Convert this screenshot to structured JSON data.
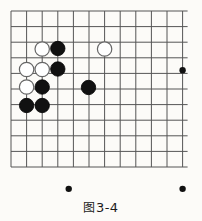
{
  "figure": {
    "caption": "图 3-4",
    "caption_label": "图",
    "caption_number": "3-4",
    "kind": "go-board-diagram"
  },
  "board": {
    "columns": 12,
    "rows": 11,
    "origin_x": 11,
    "origin_y": 11,
    "spacing_x": 15.6,
    "spacing_y": 15.6,
    "line_color": "#555555",
    "line_width": 1,
    "background": "#fcfbf8",
    "star_point_color": "#111111",
    "star_point_radius": 3.2,
    "star_points": [
      {
        "col": 11,
        "row": 3.8,
        "name": "star-right"
      },
      {
        "col": 3.7,
        "row": 11.4,
        "name": "star-bottom-left"
      },
      {
        "col": 11,
        "row": 11.4,
        "name": "star-bottom-right"
      }
    ]
  },
  "stones": {
    "black_fill": "#111111",
    "black_stroke": "#000000",
    "white_fill": "#ffffff",
    "white_stroke": "#666666",
    "radius": 7.2,
    "items": [
      {
        "id": "w1",
        "color": "white",
        "cx": 42.2,
        "cy": 49.0,
        "label": "white-stone"
      },
      {
        "id": "b1",
        "color": "black",
        "cx": 57.8,
        "cy": 48.5,
        "label": "black-stone"
      },
      {
        "id": "w2",
        "color": "white",
        "cx": 104.6,
        "cy": 49.0,
        "label": "white-stone"
      },
      {
        "id": "w3",
        "color": "white",
        "cx": 26.6,
        "cy": 69.5,
        "label": "white-stone"
      },
      {
        "id": "w4",
        "color": "white",
        "cx": 42.2,
        "cy": 69.5,
        "label": "white-stone"
      },
      {
        "id": "b2",
        "color": "black",
        "cx": 57.8,
        "cy": 69.0,
        "label": "black-stone"
      },
      {
        "id": "w5",
        "color": "white",
        "cx": 26.6,
        "cy": 87.0,
        "label": "white-stone"
      },
      {
        "id": "b3",
        "color": "black",
        "cx": 42.2,
        "cy": 87.0,
        "label": "black-stone"
      },
      {
        "id": "b4",
        "color": "black",
        "cx": 88.5,
        "cy": 87.5,
        "label": "black-stone"
      },
      {
        "id": "b5",
        "color": "black",
        "cx": 26.6,
        "cy": 105.5,
        "label": "black-stone"
      },
      {
        "id": "b6",
        "color": "black",
        "cx": 42.2,
        "cy": 105.5,
        "label": "black-stone"
      }
    ]
  }
}
